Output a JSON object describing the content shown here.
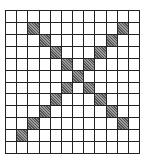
{
  "diagram": {
    "type": "pixel-grid",
    "rows": 12,
    "cols": 12,
    "fill_color": "#6e6e6e",
    "line_color": "#222222",
    "pattern": "X",
    "filled_cells": [
      [
        1,
        2
      ],
      [
        1,
        10
      ],
      [
        2,
        3
      ],
      [
        2,
        9
      ],
      [
        3,
        4
      ],
      [
        3,
        8
      ],
      [
        4,
        5
      ],
      [
        4,
        7
      ],
      [
        5,
        6
      ],
      [
        6,
        5
      ],
      [
        6,
        7
      ],
      [
        7,
        4
      ],
      [
        7,
        8
      ],
      [
        8,
        3
      ],
      [
        8,
        9
      ],
      [
        9,
        2
      ],
      [
        9,
        10
      ],
      [
        10,
        1
      ]
    ]
  }
}
